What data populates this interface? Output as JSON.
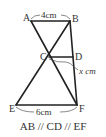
{
  "figure": {
    "points": {
      "A": {
        "label": "A",
        "x": 31,
        "y": 21
      },
      "B": {
        "label": "B",
        "x": 70,
        "y": 21
      },
      "C": {
        "label": "C",
        "x": 49,
        "y": 57
      },
      "D": {
        "label": "D",
        "x": 73,
        "y": 57
      },
      "E": {
        "label": "E",
        "x": 16,
        "y": 105
      },
      "F": {
        "label": "F",
        "x": 77,
        "y": 105
      }
    },
    "measures": {
      "AB": "4cm",
      "CD": "x cm",
      "EF": "6cm"
    },
    "caption": "AB // CD // EF"
  }
}
